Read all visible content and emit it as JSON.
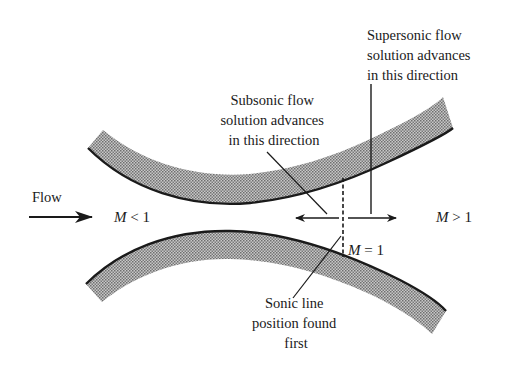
{
  "diagram": {
    "labels": {
      "flow": "Flow",
      "subsonic_mach": {
        "symbol": "M",
        "relation": " < 1"
      },
      "supersonic_mach": {
        "symbol": "M",
        "relation": " > 1"
      },
      "sonic_mach": {
        "symbol": "M",
        "relation": " = 1"
      },
      "subsonic_note": [
        "Subsonic flow",
        "solution advances",
        "in this direction"
      ],
      "supersonic_note": [
        "Supersonic flow",
        "solution advances",
        "in this direction"
      ],
      "sonic_note": [
        "Sonic line",
        "position found",
        "first"
      ]
    },
    "colors": {
      "ink": "#1a1a1a",
      "wall_fill": "#9a9a9a",
      "background": "#ffffff"
    }
  }
}
